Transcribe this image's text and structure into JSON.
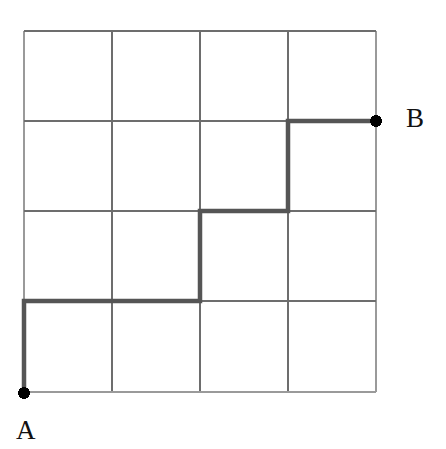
{
  "figure": {
    "type": "lattice-path-diagram",
    "width": 446,
    "height": 449,
    "background_color": "#ffffff"
  },
  "labels": {
    "start": "A",
    "end": "B"
  },
  "colors": {
    "grid_line": "#6d6d6d",
    "grid_border": "#9a9a9a",
    "path_line": "#555555",
    "point_fill": "#000000",
    "label_text": "#111111",
    "background": "#ffffff"
  },
  "grid": {
    "columns": 4,
    "rows": 4,
    "x_positions": [
      24,
      112,
      200,
      288,
      376
    ],
    "y_positions": [
      31,
      121,
      211,
      301,
      392
    ],
    "cell_width": 88,
    "cell_height": 90,
    "line_width": 1.6,
    "border_width": 2.2
  },
  "points": [
    {
      "name": "A",
      "x": 24,
      "y": 393,
      "radius": 6,
      "label": "A"
    },
    {
      "name": "B",
      "x": 376,
      "y": 121,
      "radius": 6,
      "label": "B"
    }
  ],
  "path": {
    "stroke_width": 4.5,
    "start": {
      "x": 24,
      "y": 393
    },
    "end": {
      "x": 376,
      "y": 121
    },
    "vertices": [
      {
        "x": 24,
        "y": 393
      },
      {
        "x": 24,
        "y": 301
      },
      {
        "x": 200,
        "y": 301
      },
      {
        "x": 200,
        "y": 211
      },
      {
        "x": 288,
        "y": 211
      },
      {
        "x": 288,
        "y": 121
      },
      {
        "x": 376,
        "y": 121
      }
    ],
    "svg_points": "24,393 24,301 200,301 200,211 288,211 288,121 376,121",
    "moves": [
      "U",
      "R",
      "R",
      "U",
      "R",
      "U",
      "R"
    ]
  },
  "chart_data": {
    "type": "line",
    "xlabel": "",
    "ylabel": "",
    "xlim": [
      0,
      4
    ],
    "ylim": [
      0,
      4
    ],
    "grid": true,
    "legend": "none",
    "categories": [
      "A",
      "B"
    ],
    "series": [
      {
        "name": "path",
        "x": [
          0,
          0,
          2,
          2,
          3,
          3,
          4
        ],
        "y": [
          0,
          1,
          1,
          2,
          2,
          3,
          3
        ]
      }
    ],
    "annotations": [
      {
        "text": "A",
        "x": 0,
        "y": 0
      },
      {
        "text": "B",
        "x": 4,
        "y": 3
      }
    ]
  }
}
